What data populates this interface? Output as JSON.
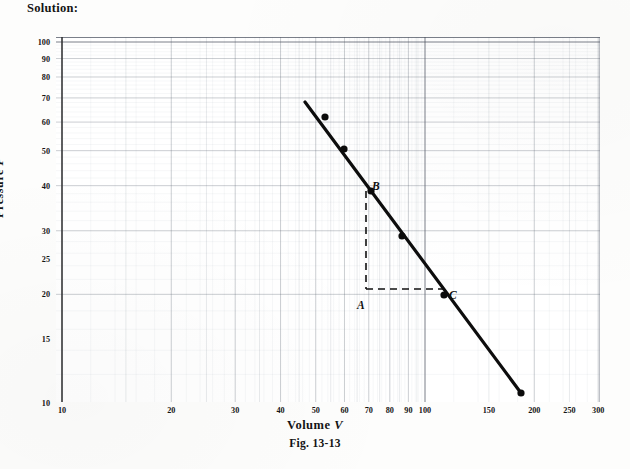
{
  "heading": "Solution:",
  "figure": {
    "caption": "Fig. 13-13",
    "xlabel_text": "Volume ",
    "xlabel_var": "V",
    "ylabel_text": "Pressure ",
    "ylabel_var": "P"
  },
  "annotations": [
    {
      "name": "point-label-a",
      "text": "A",
      "x": 357,
      "y": 299
    },
    {
      "name": "point-label-b",
      "text": "B",
      "x": 372,
      "y": 180
    },
    {
      "name": "point-label-c",
      "text": "C",
      "x": 449,
      "y": 289
    }
  ],
  "chart_data": {
    "type": "scatter",
    "title": "Fig. 13-13",
    "xlabel": "Volume V",
    "ylabel": "Pressure P",
    "xscale": "log",
    "yscale": "log",
    "xlim": [
      9.58,
      330
    ],
    "ylim": [
      9.68,
      112
    ],
    "grid": true,
    "grid_style": "log-log graph paper (major decade lines plus minor log subdivisions)",
    "legend": "none",
    "xticks": [
      10,
      20,
      30,
      40,
      50,
      60,
      70,
      80,
      90,
      100,
      150,
      200,
      250,
      300
    ],
    "xticklabels": [
      "10",
      "20",
      "30",
      "40",
      "50",
      "60",
      "70",
      "80",
      "90",
      "100",
      "150",
      "200",
      "250",
      "300"
    ],
    "yticks": [
      10,
      15,
      20,
      25,
      30,
      40,
      50,
      60,
      70,
      80,
      90,
      100
    ],
    "yticklabels": [
      "10",
      "15",
      "20",
      "25",
      "30",
      "40",
      "50",
      "60",
      "70",
      "80",
      "90",
      "100"
    ],
    "series": [
      {
        "name": "Measured P vs V",
        "marker": "filled-circle",
        "color": "#111111",
        "points": [
          {
            "x": 54.3,
            "y": 61.2
          },
          {
            "x": 61.8,
            "y": 49.5
          },
          {
            "x": 72.4,
            "y": 38.8
          },
          {
            "x": 88.7,
            "y": 28.4
          },
          {
            "x": 118.6,
            "y": 19.7
          },
          {
            "x": 194.0,
            "y": 10.2
          }
        ]
      },
      {
        "name": "Best-fit straight line (log-log)",
        "type": "line",
        "color": "#111111",
        "endpoints": [
          {
            "x": 48.5,
            "y": 69.0
          },
          {
            "x": 196.0,
            "y": 10.1
          }
        ]
      }
    ],
    "construction_triangle": {
      "description": "Dashed slope-construction triangle with vertices A, B, C",
      "vertices": [
        {
          "label": "A",
          "x": 70.0,
          "y": 20.0
        },
        {
          "label": "B",
          "x": 70.0,
          "y": 40.0
        },
        {
          "label": "C",
          "x": 118.0,
          "y": 20.0
        }
      ],
      "line_style": "dashed"
    }
  },
  "geometry": {
    "plot": {
      "left": 56,
      "top": 37,
      "width": 544,
      "height": 365
    },
    "x_axis": {
      "px_at_10": 6,
      "px_per_decade": 363
    },
    "y_axis": {
      "px_at_100": 5,
      "px_per_decade": 361
    },
    "line_px": [
      [
        249,
        65
      ],
      [
        465,
        356
      ]
    ],
    "points_px": [
      [
        269,
        80
      ],
      [
        288,
        112
      ],
      [
        315,
        154
      ],
      [
        346,
        199
      ],
      [
        388,
        258
      ],
      [
        465,
        356
      ]
    ],
    "dashes": {
      "vertical_px": [
        [
          310,
          154
        ],
        [
          310,
          252
        ]
      ],
      "horizontal_px": [
        [
          310,
          252
        ],
        [
          390,
          252
        ]
      ]
    }
  }
}
